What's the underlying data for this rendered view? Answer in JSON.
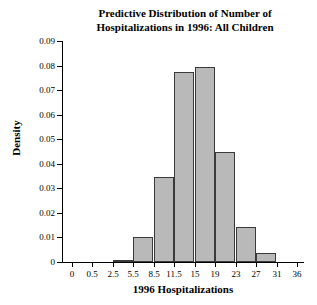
{
  "chart_data": {
    "type": "bar",
    "title": "Predictive Distribution of Number of Hospitalizations in 1996: All Children",
    "title_lines": [
      "Predictive Distribution of Number of",
      "Hospitalizations in 1996: All Children"
    ],
    "xlabel": "1996 Hospitalizations",
    "ylabel": "Density",
    "ylim": [
      0,
      0.09
    ],
    "ytick_labels": [
      "0",
      "0.01",
      "0.02",
      "0.03",
      "0.04",
      "0.05",
      "0.06",
      "0.07",
      "0.08",
      "0.09"
    ],
    "ytick_values": [
      0,
      0.01,
      0.02,
      0.03,
      0.04,
      0.05,
      0.06,
      0.07,
      0.08,
      0.09
    ],
    "xtick_labels": [
      "0",
      "0.5",
      "2.5",
      "5.5",
      "8.5",
      "11.5",
      "15",
      "19",
      "23",
      "27",
      "31",
      "36"
    ],
    "xtick_values": [
      0,
      0.5,
      2.5,
      5.5,
      8.5,
      11.5,
      15,
      19,
      23,
      27,
      31,
      36
    ],
    "grid": false,
    "legend": false,
    "bar_fill_color": "#b9b9b9",
    "bar_edge_color": "#3a3a3a",
    "bins": [
      {
        "label": "0-0.5",
        "x_start": 0,
        "x_end": 0.5,
        "density": 0.0
      },
      {
        "label": "0.5-2.5",
        "x_start": 0.5,
        "x_end": 2.5,
        "density": 0.0
      },
      {
        "label": "2.5-5.5",
        "x_start": 2.5,
        "x_end": 5.5,
        "density": 0.0008
      },
      {
        "label": "5.5-8.5",
        "x_start": 5.5,
        "x_end": 8.5,
        "density": 0.0102
      },
      {
        "label": "8.5-11.5",
        "x_start": 8.5,
        "x_end": 11.5,
        "density": 0.0346
      },
      {
        "label": "11.5-15",
        "x_start": 11.5,
        "x_end": 15,
        "density": 0.0773
      },
      {
        "label": "15-19",
        "x_start": 15,
        "x_end": 19,
        "density": 0.0795
      },
      {
        "label": "19-23",
        "x_start": 19,
        "x_end": 23,
        "density": 0.0448
      },
      {
        "label": "23-27",
        "x_start": 23,
        "x_end": 27,
        "density": 0.0143
      },
      {
        "label": "27-31",
        "x_start": 27,
        "x_end": 31,
        "density": 0.0037
      },
      {
        "label": "31-36",
        "x_start": 31,
        "x_end": 36,
        "density": 0.0
      }
    ]
  }
}
